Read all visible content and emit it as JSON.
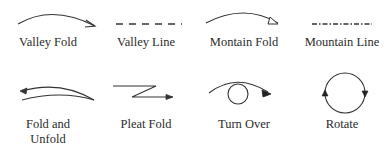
{
  "diagram": {
    "type": "origami-symbol-legend",
    "stroke_color": "#333333",
    "symbols": [
      {
        "id": "valley-fold",
        "label": "Valley Fold",
        "icon": "curved-arrow-open-head"
      },
      {
        "id": "valley-line",
        "label": "Valley Line",
        "icon": "dashed-line"
      },
      {
        "id": "mountain-fold",
        "label": "Montain Fold",
        "icon": "curved-arrow-hollow-triangle-head"
      },
      {
        "id": "mountain-line",
        "label": "Mountain Line",
        "icon": "dash-dot-line"
      },
      {
        "id": "fold-and-unfold",
        "label": "Fold and\nUnfold",
        "label_line1": "Fold and",
        "label_line2": "Unfold",
        "icon": "double-curve-return-arrow"
      },
      {
        "id": "pleat-fold",
        "label": "Pleat Fold",
        "icon": "zigzag-arrow"
      },
      {
        "id": "turn-over",
        "label": "Turn Over",
        "icon": "loop-arrow"
      },
      {
        "id": "rotate",
        "label": "Rotate",
        "icon": "circle-two-arrowheads"
      }
    ]
  }
}
